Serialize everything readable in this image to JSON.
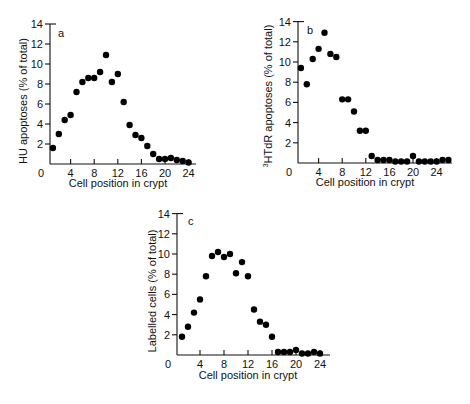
{
  "chart_data": [
    {
      "type": "scatter",
      "panel": "a",
      "xlabel": "Cell position in crypt",
      "ylabel": "HU apoptoses (% of total)",
      "xlim": [
        0,
        24
      ],
      "ylim": [
        0,
        14
      ],
      "xticks": [
        0,
        4,
        8,
        12,
        16,
        20,
        24
      ],
      "yticks": [
        2,
        4,
        6,
        8,
        10,
        12,
        14
      ],
      "grid": false,
      "points": [
        [
          1,
          1.6
        ],
        [
          2,
          3.0
        ],
        [
          3,
          4.4
        ],
        [
          4,
          4.9
        ],
        [
          5,
          7.2
        ],
        [
          6,
          8.2
        ],
        [
          7,
          8.6
        ],
        [
          8,
          8.6
        ],
        [
          9,
          9.2
        ],
        [
          10,
          10.9
        ],
        [
          11,
          8.2
        ],
        [
          12,
          9.0
        ],
        [
          13,
          6.2
        ],
        [
          14,
          3.9
        ],
        [
          15,
          2.9
        ],
        [
          16,
          2.6
        ],
        [
          17,
          1.8
        ],
        [
          18,
          1.0
        ],
        [
          19,
          0.5
        ],
        [
          20,
          0.5
        ],
        [
          21,
          0.6
        ],
        [
          22,
          0.4
        ],
        [
          23,
          0.3
        ],
        [
          24,
          0.1
        ]
      ]
    },
    {
      "type": "scatter",
      "panel": "b",
      "xlabel": "Cell position in crypt",
      "ylabel_sup": "3",
      "ylabel": "HTdR apoptoses (% of total)",
      "xlim": [
        0,
        26
      ],
      "ylim": [
        0,
        14
      ],
      "xticks": [
        0,
        4,
        8,
        12,
        16,
        20,
        24
      ],
      "yticks": [
        2,
        4,
        6,
        8,
        10,
        12,
        14
      ],
      "grid": false,
      "points": [
        [
          1,
          9.4
        ],
        [
          2,
          7.8
        ],
        [
          3,
          10.3
        ],
        [
          4,
          11.3
        ],
        [
          5,
          12.9
        ],
        [
          6,
          10.8
        ],
        [
          7,
          10.5
        ],
        [
          8,
          6.3
        ],
        [
          9,
          6.3
        ],
        [
          10,
          5.1
        ],
        [
          11,
          3.2
        ],
        [
          12,
          3.2
        ],
        [
          13,
          0.7
        ],
        [
          14,
          0.3
        ],
        [
          15,
          0.3
        ],
        [
          16,
          0.3
        ],
        [
          17,
          0.0
        ],
        [
          18,
          0.0
        ],
        [
          19,
          0.0
        ],
        [
          20,
          0.7
        ],
        [
          21,
          0.0
        ],
        [
          22,
          0.0
        ],
        [
          23,
          0.0
        ],
        [
          24,
          0.0
        ],
        [
          25,
          0.3
        ],
        [
          26,
          0.3
        ]
      ]
    },
    {
      "type": "scatter",
      "panel": "c",
      "xlabel": "Cell position in crypt",
      "ylabel": "Labelled cells (% of total)",
      "xlim": [
        0,
        24
      ],
      "ylim": [
        0,
        14
      ],
      "xticks": [
        0,
        4,
        8,
        12,
        16,
        20,
        24
      ],
      "yticks": [
        2,
        4,
        6,
        8,
        10,
        12,
        14
      ],
      "grid": false,
      "points": [
        [
          1,
          1.8
        ],
        [
          2,
          2.8
        ],
        [
          3,
          4.2
        ],
        [
          4,
          5.5
        ],
        [
          5,
          7.8
        ],
        [
          6,
          9.8
        ],
        [
          7,
          10.2
        ],
        [
          8,
          9.7
        ],
        [
          9,
          10.0
        ],
        [
          10,
          8.1
        ],
        [
          11,
          9.2
        ],
        [
          12,
          7.8
        ],
        [
          13,
          4.5
        ],
        [
          14,
          3.3
        ],
        [
          15,
          3.0
        ],
        [
          16,
          1.8
        ],
        [
          17,
          0.3
        ],
        [
          18,
          0.3
        ],
        [
          19,
          0.3
        ],
        [
          20,
          0.5
        ],
        [
          21,
          0.05
        ],
        [
          22,
          0.05
        ],
        [
          23,
          0.3
        ],
        [
          24,
          0.0
        ]
      ]
    }
  ],
  "panels": {
    "a": {
      "letter": "a",
      "xlabel": "Cell position in crypt",
      "ylabel": "HU apoptoses (% of total)",
      "zero": "0"
    },
    "b": {
      "letter": "b",
      "xlabel": "Cell position in crypt",
      "ylabel_sup": "3",
      "ylabel": "HTdR apoptoses (% of total)",
      "zero": "0"
    },
    "c": {
      "letter": "c",
      "xlabel": "Cell position in crypt",
      "ylabel": "Labelled cells (% of total)",
      "zero": "0"
    }
  }
}
